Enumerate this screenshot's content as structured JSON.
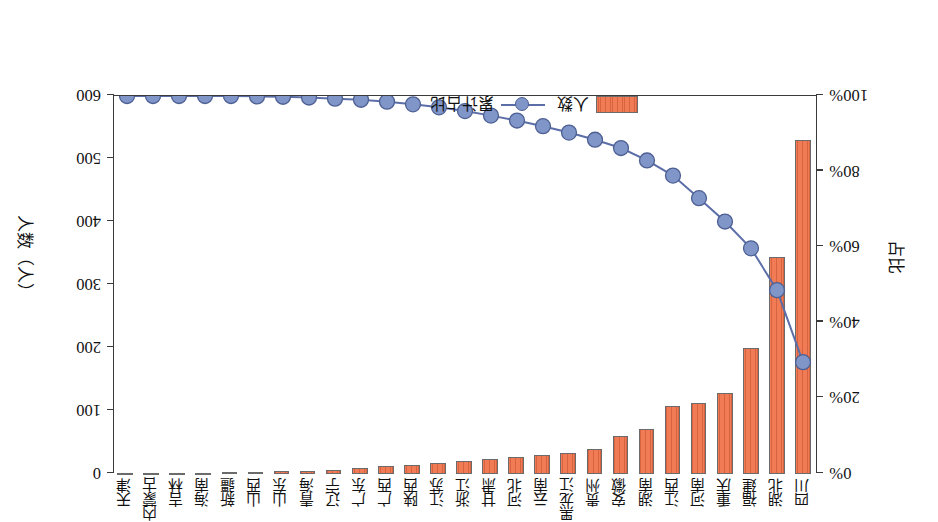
{
  "chart_data": {
    "type": "bar",
    "title": "",
    "orientation_note": "figure printed upside-down (rotated 180 degrees)",
    "categories": [
      "四川",
      "湖北",
      "福建",
      "重庆",
      "河南",
      "江西",
      "湖南",
      "安徽",
      "贵州",
      "黑龙江",
      "云南",
      "河北",
      "甘肃",
      "浙江",
      "江苏",
      "陕西",
      "广西",
      "广东",
      "辽宁",
      "青海",
      "山东",
      "山西",
      "新疆",
      "海南",
      "吉林",
      "内蒙古",
      "天津"
    ],
    "series": [
      {
        "name": "人数",
        "type": "bar",
        "axis": "right",
        "unit": "人",
        "values": [
          530,
          345,
          200,
          128,
          112,
          108,
          72,
          60,
          40,
          34,
          30,
          27,
          24,
          21,
          18,
          15,
          12,
          9,
          6,
          5,
          4,
          3,
          3,
          2,
          2,
          1,
          1
        ]
      },
      {
        "name": "累计占比",
        "type": "line",
        "axis": "left",
        "unit": "%",
        "values": [
          29.4,
          48.5,
          59.6,
          66.7,
          72.9,
          78.9,
          82.9,
          86.2,
          88.4,
          90.3,
          92.0,
          93.5,
          94.8,
          96.0,
          97.0,
          97.8,
          98.5,
          99.0,
          99.3,
          99.6,
          99.8,
          99.9,
          100.0,
          100.0,
          100.0,
          100.0,
          100.0
        ]
      }
    ],
    "left_axis": {
      "title": "占比",
      "ticks": [
        "0%",
        "20%",
        "40%",
        "60%",
        "80%",
        "100%"
      ],
      "min": 0,
      "max": 100,
      "step": 20
    },
    "right_axis": {
      "title": "人数（人）",
      "ticks": [
        "0",
        "100",
        "200",
        "300",
        "400",
        "500",
        "600"
      ],
      "min": 0,
      "max": 600,
      "step": 100
    },
    "legend": {
      "position": "inside-lower-left",
      "entries": [
        {
          "label": "人数",
          "marker": "bar-swatch",
          "color": "#F07B55"
        },
        {
          "label": "累计占比",
          "marker": "line-circle",
          "color": "#8096c8"
        }
      ]
    },
    "grid": false,
    "colors": {
      "bar_fill": "#F07B55",
      "bar_border": "#6b6b6b",
      "line": "#5b6ea8",
      "marker_fill": "#8096c8",
      "marker_border": "#4d5f93",
      "axis": "#3a3a3a",
      "background": "#ffffff"
    }
  }
}
